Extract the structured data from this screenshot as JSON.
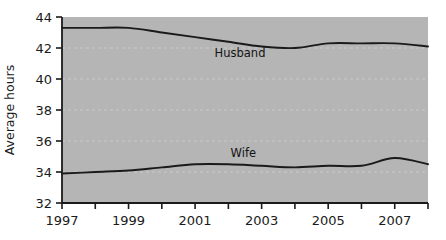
{
  "chart_data": {
    "type": "line",
    "title": "",
    "xlabel": "",
    "ylabel": "Average hours",
    "xlim": [
      1997,
      2008
    ],
    "ylim": [
      32,
      44
    ],
    "grid": true,
    "legend_position": "inline-annotation",
    "x": [
      1997,
      1998,
      1999,
      2000,
      2001,
      2002,
      2003,
      2004,
      2005,
      2006,
      2007,
      2008
    ],
    "xtick_labels": [
      "1997",
      "",
      "1999",
      "",
      "2001",
      "",
      "2003",
      "",
      "2005",
      "",
      "2007",
      ""
    ],
    "xtick_labels_shown": [
      "1997",
      "1999",
      "2001",
      "2003",
      "2005",
      "2007"
    ],
    "ytick_labels": [
      "32",
      "34",
      "36",
      "38",
      "40",
      "42",
      "44"
    ],
    "yticks": [
      32,
      34,
      36,
      38,
      40,
      42,
      44
    ],
    "series": [
      {
        "name": "Husband",
        "label": "Husband",
        "color": "#1a1a1a",
        "values": [
          43.3,
          43.3,
          43.3,
          43.0,
          42.7,
          42.4,
          42.1,
          42.0,
          42.3,
          42.3,
          42.3,
          42.1
        ]
      },
      {
        "name": "Wife",
        "label": "Wife",
        "color": "#1a1a1a",
        "values": [
          33.9,
          34.0,
          34.1,
          34.3,
          34.5,
          34.5,
          34.4,
          34.3,
          34.4,
          34.4,
          34.9,
          34.5
        ]
      }
    ],
    "annotations": [
      {
        "text": "Husband",
        "x": 2002.35,
        "y": 41.45
      },
      {
        "text": "Wife",
        "x": 2002.45,
        "y": 34.95
      }
    ],
    "colors": {
      "plot_background": "#b5b5b5",
      "page_background": "#ffffff",
      "gridline": "#c9c9c9",
      "axis": "#1a1a1a",
      "line": "#1a1a1a",
      "tick_text": "#1a1a1a"
    }
  }
}
